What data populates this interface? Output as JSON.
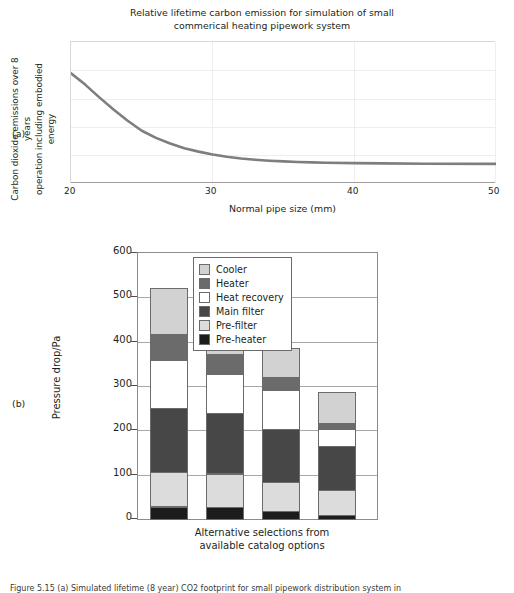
{
  "panel_a": {
    "tag": "(a)",
    "title": "Relative lifetime carbon emission for simulation of small commerical heating pipework system",
    "title_line1": "Relative lifetime carbon emission for simulation of small",
    "title_line2": "commerical heating pipework system",
    "ylabel": "Carbon dioxide emissions over 8 years operation including embodied energy",
    "ylabel_line1": "Carbon dioxide emissions over 8 years",
    "ylabel_line2": "operation including embodied energy",
    "xlabel": "Normal pipe size (mm)",
    "xticks": [
      "20",
      "30",
      "40",
      "50"
    ]
  },
  "panel_b": {
    "tag": "(b)",
    "ylabel": "Pressure drop/Pa",
    "xlabel_line1": "Alternative selections from",
    "xlabel_line2": "available catalog options",
    "yticks": [
      "600",
      "500",
      "400",
      "300",
      "200",
      "100",
      "0"
    ]
  },
  "caption": "Figure 5.15  (a) Simulated lifetime (8 year) CO2 footprint for small pipework distribution system in",
  "colors": {
    "cooler": "#d2d2d2",
    "heater": "#6b6b6b",
    "heat_recovery": "#ffffff",
    "main_filter": "#474747",
    "pre_filter": "#dcdcdc",
    "pre_heater": "#1c1c1c",
    "curve": "#7e7e7e",
    "axis": "#8c8c8c",
    "grid": "#ededf2",
    "text": "#231f20"
  },
  "chart_data": [
    {
      "type": "line",
      "title": "Relative lifetime carbon emission for simulation of small commerical heating pipework system",
      "xlabel": "Normal pipe size (mm)",
      "ylabel": "Carbon dioxide emissions over 8 years operation including embodied energy",
      "xlim": [
        20,
        50
      ],
      "ylim": [
        0,
        1
      ],
      "xticks": [
        20,
        30,
        40,
        50
      ],
      "yticks": [],
      "grid": true,
      "legend": "none",
      "series": [
        {
          "name": "CO2 emission",
          "x": [
            20,
            21,
            22,
            23,
            24,
            25,
            26,
            27,
            28,
            29,
            30,
            31,
            32,
            33,
            34,
            35,
            36,
            37,
            38,
            40,
            42,
            45,
            50
          ],
          "y": [
            0.78,
            0.7,
            0.61,
            0.525,
            0.445,
            0.375,
            0.325,
            0.285,
            0.252,
            0.228,
            0.208,
            0.192,
            0.18,
            0.171,
            0.164,
            0.159,
            0.155,
            0.152,
            0.15,
            0.147,
            0.145,
            0.143,
            0.142
          ]
        }
      ]
    },
    {
      "type": "bar",
      "stacked": true,
      "xlabel": "Alternative selections from available catalog options",
      "ylabel": "Pressure drop/Pa",
      "ylim": [
        0,
        600
      ],
      "yticks": [
        0,
        100,
        200,
        300,
        400,
        500,
        600
      ],
      "grid": true,
      "legend_position": "upper right",
      "categories": [
        "Option 1",
        "Option 2",
        "Option 3",
        "Option 4"
      ],
      "totals": [
        532,
        473,
        397,
        298
      ],
      "series": [
        {
          "name": "Pre-heater",
          "color": "#1c1c1c",
          "values": [
            30,
            28,
            20,
            11
          ]
        },
        {
          "name": "Pre-filter",
          "color": "#dcdcdc",
          "values": [
            80,
            78,
            67,
            57
          ]
        },
        {
          "name": "Main filter",
          "color": "#474747",
          "values": [
            145,
            138,
            122,
            102
          ]
        },
        {
          "name": "Heat recovery",
          "color": "#ffffff",
          "values": [
            110,
            90,
            90,
            40
          ]
        },
        {
          "name": "Heater",
          "color": "#6b6b6b",
          "values": [
            62,
            47,
            29,
            15
          ]
        },
        {
          "name": "Cooler",
          "color": "#d2d2d2",
          "values": [
            105,
            92,
            69,
            73
          ]
        }
      ],
      "legend_order": [
        "Cooler",
        "Heater",
        "Heat recovery",
        "Main filter",
        "Pre-filter",
        "Pre-heater"
      ]
    }
  ]
}
